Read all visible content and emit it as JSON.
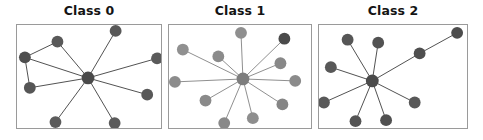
{
  "figure": {
    "width": 483,
    "height": 140,
    "background": "#ffffff"
  },
  "chart_data": {
    "type": "scatter",
    "title": "",
    "subtitle": "",
    "xlabel": "",
    "ylabel": "",
    "grid": false,
    "legend": "none",
    "panels": [
      {
        "title": "Class 0",
        "axes": {
          "x": 16,
          "y": 24,
          "width": 146,
          "height": 105
        },
        "node_color": "#5a5a5a",
        "edge_color": "#4f4f4f",
        "hub_index": 0,
        "node_radius": 6,
        "hub_radius": 6.5,
        "nodes": [
          {
            "id": 0,
            "x": 88,
            "y": 78,
            "color": "#4a4a4a",
            "role": "hub"
          },
          {
            "id": 1,
            "x": 57,
            "y": 41,
            "color": "#595959",
            "role": "leaf"
          },
          {
            "id": 2,
            "x": 24,
            "y": 57,
            "color": "#4e4e4e",
            "role": "leaf"
          },
          {
            "id": 3,
            "x": 29,
            "y": 88,
            "color": "#565656",
            "role": "leaf"
          },
          {
            "id": 4,
            "x": 55,
            "y": 123,
            "color": "#5c5c5c",
            "role": "leaf"
          },
          {
            "id": 5,
            "x": 116,
            "y": 30,
            "color": "#585858",
            "role": "leaf"
          },
          {
            "id": 6,
            "x": 158,
            "y": 58,
            "color": "#5a5a5a",
            "role": "leaf"
          },
          {
            "id": 7,
            "x": 148,
            "y": 95,
            "color": "#585858",
            "role": "leaf"
          },
          {
            "id": 8,
            "x": 115,
            "y": 124,
            "color": "#5b5b5b",
            "role": "leaf"
          }
        ],
        "edges": [
          {
            "from": 0,
            "to": 1
          },
          {
            "from": 0,
            "to": 2
          },
          {
            "from": 0,
            "to": 3
          },
          {
            "from": 0,
            "to": 4
          },
          {
            "from": 0,
            "to": 5
          },
          {
            "from": 0,
            "to": 6
          },
          {
            "from": 0,
            "to": 7
          },
          {
            "from": 0,
            "to": 8
          },
          {
            "from": 1,
            "to": 2
          },
          {
            "from": 2,
            "to": 3
          }
        ]
      },
      {
        "title": "Class 1",
        "axes": {
          "x": 168,
          "y": 24,
          "width": 144,
          "height": 105
        },
        "node_color": "#8d8d8d",
        "edge_color": "#8d8d8d",
        "hub_index": 0,
        "node_radius": 6,
        "hub_radius": 6.5,
        "nodes": [
          {
            "id": 0,
            "x": 243,
            "y": 79,
            "color": "#7d7d7d",
            "role": "hub"
          },
          {
            "id": 1,
            "x": 241,
            "y": 32,
            "color": "#8f8f8f",
            "role": "leaf"
          },
          {
            "id": 2,
            "x": 182,
            "y": 49,
            "color": "#909090",
            "role": "leaf"
          },
          {
            "id": 3,
            "x": 218,
            "y": 56,
            "color": "#8b8b8b",
            "role": "leaf"
          },
          {
            "id": 4,
            "x": 174,
            "y": 82,
            "color": "#8c8c8c",
            "role": "leaf"
          },
          {
            "id": 5,
            "x": 205,
            "y": 101,
            "color": "#8a8a8a",
            "role": "leaf"
          },
          {
            "id": 6,
            "x": 224,
            "y": 124,
            "color": "#898989",
            "role": "leaf"
          },
          {
            "id": 7,
            "x": 253,
            "y": 119,
            "color": "#8e8e8e",
            "role": "leaf"
          },
          {
            "id": 8,
            "x": 283,
            "y": 105,
            "color": "#858585",
            "role": "leaf"
          },
          {
            "id": 9,
            "x": 296,
            "y": 81,
            "color": "#8b8b8b",
            "role": "leaf"
          },
          {
            "id": 10,
            "x": 281,
            "y": 63,
            "color": "#888888",
            "role": "leaf"
          },
          {
            "id": 11,
            "x": 285,
            "y": 38,
            "color": "#4a4a4a",
            "role": "leaf"
          }
        ],
        "edges": [
          {
            "from": 0,
            "to": 1
          },
          {
            "from": 0,
            "to": 2
          },
          {
            "from": 0,
            "to": 3
          },
          {
            "from": 0,
            "to": 4
          },
          {
            "from": 0,
            "to": 5
          },
          {
            "from": 0,
            "to": 6
          },
          {
            "from": 0,
            "to": 7
          },
          {
            "from": 0,
            "to": 8
          },
          {
            "from": 0,
            "to": 9
          },
          {
            "from": 0,
            "to": 10
          },
          {
            "from": 0,
            "to": 11
          }
        ]
      },
      {
        "title": "Class 2",
        "axes": {
          "x": 318,
          "y": 24,
          "width": 150,
          "height": 105
        },
        "node_color": "#565656",
        "edge_color": "#4f4f4f",
        "hub_index": 0,
        "node_radius": 6,
        "hub_radius": 6.5,
        "nodes": [
          {
            "id": 0,
            "x": 372,
            "y": 81,
            "color": "#4a4a4a",
            "role": "hub"
          },
          {
            "id": 1,
            "x": 347,
            "y": 39,
            "color": "#565656",
            "role": "leaf"
          },
          {
            "id": 2,
            "x": 378,
            "y": 42,
            "color": "#525252",
            "role": "leaf"
          },
          {
            "id": 3,
            "x": 330,
            "y": 67,
            "color": "#585858",
            "role": "leaf"
          },
          {
            "id": 4,
            "x": 323,
            "y": 103,
            "color": "#595959",
            "role": "leaf"
          },
          {
            "id": 5,
            "x": 355,
            "y": 122,
            "color": "#545454",
            "role": "leaf"
          },
          {
            "id": 6,
            "x": 386,
            "y": 121,
            "color": "#505050",
            "role": "leaf"
          },
          {
            "id": 7,
            "x": 415,
            "y": 103,
            "color": "#585858",
            "role": "leaf"
          },
          {
            "id": 8,
            "x": 420,
            "y": 53,
            "color": "#4f4f4f",
            "role": "leaf"
          },
          {
            "id": 9,
            "x": 458,
            "y": 32,
            "color": "#4d4d4d",
            "role": "leaf"
          }
        ],
        "edges": [
          {
            "from": 0,
            "to": 1
          },
          {
            "from": 0,
            "to": 2
          },
          {
            "from": 0,
            "to": 3
          },
          {
            "from": 0,
            "to": 4
          },
          {
            "from": 0,
            "to": 5
          },
          {
            "from": 0,
            "to": 6
          },
          {
            "from": 0,
            "to": 7
          },
          {
            "from": 0,
            "to": 8
          },
          {
            "from": 8,
            "to": 9
          }
        ]
      }
    ]
  }
}
